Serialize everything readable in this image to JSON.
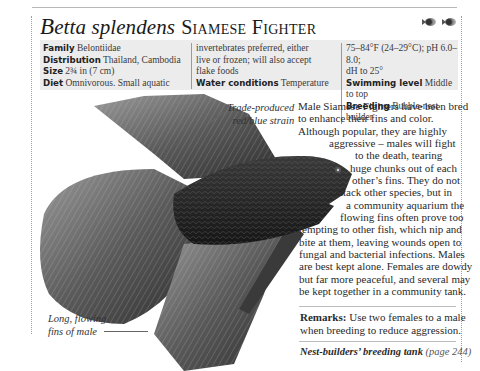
{
  "header": {
    "latin_name_first": "B",
    "latin_name_rest": "etta splendens",
    "common_name": "Siamese Fighter",
    "icons": [
      "fish-symbol-icon",
      "fish-symbol-icon"
    ]
  },
  "factbox": {
    "col1": [
      {
        "label": "Family",
        "value": "Belontiidae"
      },
      {
        "label": "Distribution",
        "value": "Thailand, Cambodia"
      },
      {
        "label": "Size",
        "value": "2¾ in (7 cm)"
      },
      {
        "label": "Diet",
        "value": "Omnivorous. Small aquatic"
      }
    ],
    "col2": [
      {
        "label": "",
        "value": "invertebrates preferred, either"
      },
      {
        "label": "",
        "value": "live or frozen; will also accept"
      },
      {
        "label": "",
        "value": "flake foods"
      },
      {
        "label": "Water conditions",
        "value": "Temperature"
      }
    ],
    "col3": [
      {
        "label": "",
        "value": "75–84°F (24–29°C); pH 6.0–8.0;"
      },
      {
        "label": "",
        "value": "dH to 25°"
      },
      {
        "label": "Swimming level",
        "value": "Middle to top"
      },
      {
        "label": "Breeding",
        "value": "Bubble-nest builder"
      }
    ]
  },
  "captions": {
    "top": [
      "Trade-produced",
      "red/blue strain"
    ],
    "bottom": [
      "Long, flowing",
      "fins of male"
    ]
  },
  "body": {
    "lines": [
      "Male Siamese Fighters have been bred",
      "to enhance their fins and color.",
      "Although popular, they are highly",
      "aggressive – males will fight",
      "to the death, tearing",
      "huge chunks out of each",
      "other’s fins. They do not",
      "attack other species, but in",
      "a community aquarium the",
      "flowing fins often prove too",
      "tempting to other fish, which nip and",
      "bite at them, leaving wounds open to",
      "fungal and bacterial infections. Males",
      "are best kept alone. Females are dowdy",
      "but far more peaceful, and several may",
      "be kept together in a community tank."
    ]
  },
  "remarks": {
    "label": "Remarks:",
    "line1": " Use two females to a male",
    "line2": "when breeding to reduce aggression."
  },
  "cross_reference": {
    "title": "Nest-builders’ breeding tank",
    "page": " (page 244)"
  },
  "colors": {
    "factbox_bg": "#ececec",
    "text": "#2a2a2a",
    "rule": "#bdbdbd"
  }
}
